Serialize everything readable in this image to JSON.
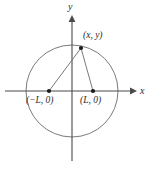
{
  "figure": {
    "kind": "coordinate-plane-circle-diagram",
    "background_color": "#ffffff",
    "stroke_color": "#555555",
    "axis_color": "#4a4a4a",
    "point_color": "#1a1a1a",
    "label_color": "#2b2b2b",
    "width": 158,
    "height": 171
  },
  "axes": {
    "x_label": "x",
    "y_label": "y",
    "origin": {
      "x": 72,
      "y": 91
    },
    "x_axis": {
      "x1": 5,
      "y1": 91,
      "x2": 133,
      "y2": 91,
      "arrow": "right"
    },
    "y_axis": {
      "x1": 72,
      "y1": 18,
      "x2": 72,
      "y2": 161,
      "arrow": "up"
    }
  },
  "circle": {
    "center": {
      "x": 72,
      "y": 91
    },
    "radius": 46
  },
  "points": [
    {
      "id": "apex",
      "label": "(x, y)",
      "cx": 81,
      "cy": 48,
      "label_dx": 2,
      "label_dy": -17
    },
    {
      "id": "left-focus",
      "label": "(−L, 0)",
      "cx": 49,
      "cy": 91,
      "label_dx": -23,
      "label_dy": 5
    },
    {
      "id": "right-focus",
      "label": "(L, 0)",
      "cx": 93,
      "cy": 91,
      "label_dx": -13,
      "label_dy": 5
    }
  ],
  "segments": [
    {
      "id": "apex-to-left-focus",
      "x1": 81,
      "y1": 48,
      "x2": 49,
      "y2": 91
    },
    {
      "id": "apex-to-right-focus",
      "x1": 81,
      "y1": 48,
      "x2": 93,
      "y2": 91
    }
  ]
}
